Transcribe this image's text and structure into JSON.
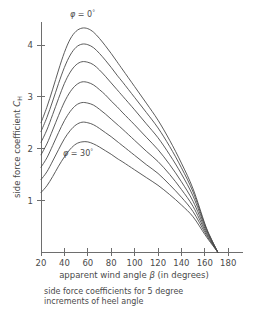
{
  "chart_data": {
    "type": "line",
    "title": "",
    "caption": "side force coefficients for 5 degree increments of heel angle",
    "caption_line1": "side force coefficients  for  5 degree",
    "caption_line2": "increments  of heel angle",
    "xlabel": "apparent wind angle β  (in degrees)",
    "xlabel_pre": "apparent wind angle ",
    "xlabel_sym": "β",
    "xlabel_post": " (in degrees)",
    "ylabel": "side force coefficient  C_H",
    "ylabel_pre": "side force coefficient  ",
    "ylabel_sym": "C",
    "ylabel_sub": "H",
    "xlim": [
      10,
      190
    ],
    "ylim": [
      0,
      4.6
    ],
    "xticks": [
      20,
      40,
      60,
      80,
      100,
      120,
      140,
      160,
      180
    ],
    "yticks": [
      1,
      2,
      3,
      4
    ],
    "grid": false,
    "legend": "none",
    "annotations": [
      {
        "name": "phi-zero-label",
        "text": "φ = 0°",
        "sym": "φ",
        "eq": " = 0",
        "deg": "°",
        "x_px": 70,
        "y_px": 17
      },
      {
        "name": "phi-thirty-label",
        "text": "φ = 30°",
        "sym": "φ",
        "eq": " = 30",
        "deg": "°",
        "x_px": 63,
        "y_px": 156
      }
    ],
    "x": [
      20,
      25,
      30,
      35,
      40,
      45,
      50,
      55,
      60,
      65,
      70,
      75,
      80,
      85,
      90,
      100,
      110,
      120,
      130,
      140,
      150,
      160,
      165,
      171
    ],
    "series": [
      {
        "name": "heel angle 0 deg",
        "phi": 0,
        "values": [
          2.5,
          2.8,
          3.15,
          3.52,
          3.86,
          4.12,
          4.27,
          4.33,
          4.32,
          4.25,
          4.13,
          3.99,
          3.84,
          3.68,
          3.52,
          3.2,
          2.88,
          2.55,
          2.16,
          1.72,
          1.22,
          0.55,
          0.28,
          0.0
        ]
      },
      {
        "name": "heel angle 5 deg",
        "phi": 5,
        "values": [
          2.33,
          2.6,
          2.92,
          3.26,
          3.57,
          3.81,
          3.96,
          4.02,
          4.01,
          3.95,
          3.84,
          3.71,
          3.57,
          3.42,
          3.28,
          2.99,
          2.7,
          2.4,
          2.04,
          1.63,
          1.16,
          0.53,
          0.27,
          0.0
        ]
      },
      {
        "name": "heel angle 10 deg",
        "phi": 10,
        "values": [
          2.12,
          2.36,
          2.66,
          2.97,
          3.26,
          3.48,
          3.62,
          3.68,
          3.67,
          3.62,
          3.52,
          3.4,
          3.27,
          3.14,
          3.01,
          2.75,
          2.48,
          2.21,
          1.88,
          1.51,
          1.08,
          0.5,
          0.26,
          0.0
        ]
      },
      {
        "name": "heel angle 15 deg",
        "phi": 15,
        "values": [
          1.88,
          2.09,
          2.36,
          2.64,
          2.9,
          3.1,
          3.23,
          3.29,
          3.28,
          3.23,
          3.14,
          3.04,
          2.92,
          2.81,
          2.69,
          2.46,
          2.22,
          1.98,
          1.69,
          1.36,
          0.98,
          0.46,
          0.24,
          0.0
        ]
      },
      {
        "name": "heel angle 20 deg",
        "phi": 20,
        "values": [
          1.64,
          1.82,
          2.06,
          2.31,
          2.54,
          2.72,
          2.84,
          2.89,
          2.88,
          2.84,
          2.76,
          2.67,
          2.57,
          2.47,
          2.37,
          2.16,
          1.95,
          1.75,
          1.5,
          1.21,
          0.88,
          0.42,
          0.22,
          0.0
        ]
      },
      {
        "name": "heel angle 25 deg",
        "phi": 25,
        "values": [
          1.4,
          1.55,
          1.76,
          1.98,
          2.19,
          2.35,
          2.46,
          2.51,
          2.5,
          2.46,
          2.39,
          2.31,
          2.23,
          2.14,
          2.05,
          1.87,
          1.69,
          1.52,
          1.3,
          1.06,
          0.78,
          0.38,
          0.2,
          0.0
        ]
      },
      {
        "name": "heel angle 30 deg",
        "phi": 30,
        "values": [
          1.15,
          1.28,
          1.46,
          1.66,
          1.84,
          1.99,
          2.09,
          2.13,
          2.13,
          2.09,
          2.03,
          1.96,
          1.89,
          1.81,
          1.74,
          1.59,
          1.44,
          1.29,
          1.11,
          0.91,
          0.68,
          0.34,
          0.18,
          0.0
        ]
      }
    ],
    "colors": {
      "curve": "#4a4a4a",
      "axis": "#6e6e6e",
      "text": "#4a4a4a",
      "background": "#ffffff"
    },
    "geometry": {
      "x_axis_y_px": 252,
      "y_axis_x_px": 41,
      "x_px_per_deg": 1.17,
      "y_px_per_unit": 51.7,
      "x_origin_deg": 20,
      "y_origin_px": 252
    }
  }
}
